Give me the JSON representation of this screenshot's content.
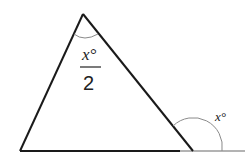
{
  "diagram": {
    "type": "triangle-exterior-angle",
    "apex_angle_label": {
      "numerator": "x°",
      "denominator": "2"
    },
    "exterior_angle_label": "x°",
    "colors": {
      "triangle_stroke": "#1a1a1a",
      "baseline_extension": "#9a9a9a",
      "arc_stroke": "#8a8a8a",
      "text": "#222222"
    }
  }
}
